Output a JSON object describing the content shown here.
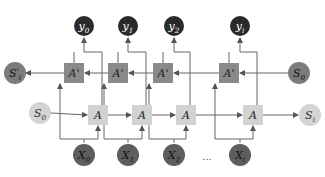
{
  "colors": {
    "output_node": "#2a2a2a",
    "input_node": "#5e5e5e",
    "backward_cell": "#8a8a8a",
    "forward_cell": "#d2d2d2",
    "backward_state": "#7c7c7c",
    "forward_state": "#d4d4d4",
    "edge": "#666666"
  },
  "outputs": [
    {
      "label": "y",
      "sub": "0"
    },
    {
      "label": "y",
      "sub": "1"
    },
    {
      "label": "y",
      "sub": "2"
    },
    {
      "label": "y",
      "sub": "i"
    }
  ],
  "backward_cells": [
    {
      "label": "A'"
    },
    {
      "label": "A'"
    },
    {
      "label": "A'"
    },
    {
      "label": "A'"
    }
  ],
  "forward_cells": [
    {
      "label": "A"
    },
    {
      "label": "A"
    },
    {
      "label": "A"
    },
    {
      "label": "A"
    }
  ],
  "inputs": [
    {
      "label": "X",
      "sub": "0"
    },
    {
      "label": "X",
      "sub": "1"
    },
    {
      "label": "X",
      "sub": "2"
    },
    {
      "label": "X",
      "sub": "i"
    }
  ],
  "states": {
    "backward_out": {
      "label": "S",
      "sub": "i",
      "prime": "'"
    },
    "backward_in": {
      "label": "S",
      "sub": "0"
    },
    "forward_in": {
      "label": "S",
      "sub": "0"
    },
    "forward_out": {
      "label": "S",
      "sub": "i"
    }
  },
  "ellipsis": "..."
}
